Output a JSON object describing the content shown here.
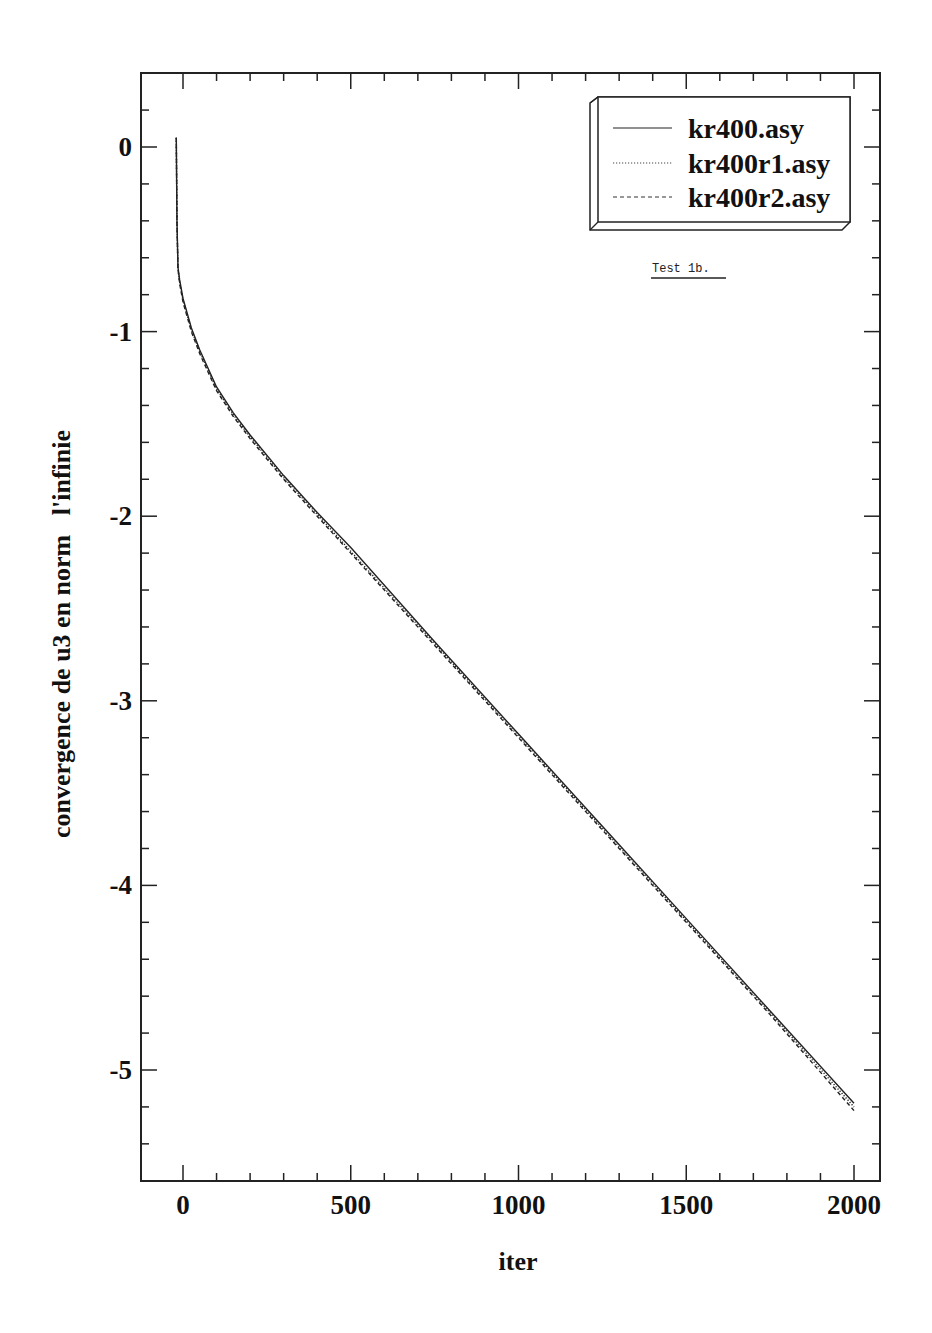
{
  "chart_data": {
    "type": "line",
    "title": "",
    "annotation": "Test 1b.",
    "xlabel": "iter",
    "ylabel": "convergence de u3 en norm   l'infinie",
    "xlim": [
      -100,
      2050
    ],
    "ylim": [
      -5.6,
      0.4
    ],
    "xticks": [
      0,
      500,
      1000,
      1500,
      2000
    ],
    "xtick_labels": [
      "0",
      "500",
      "1000",
      "1500",
      "2000"
    ],
    "yticks": [
      0,
      -1,
      -2,
      -3,
      -4,
      -5
    ],
    "ytick_labels": [
      "0",
      "-1",
      "-2",
      "-3",
      "-4",
      "-5"
    ],
    "grid": false,
    "legend_position": "upper right",
    "series": [
      {
        "name": "kr400.asy",
        "style": "solid",
        "x": [
          -20,
          -18,
          -15,
          -10,
          0,
          25,
          50,
          100,
          150,
          200,
          300,
          400,
          500,
          750,
          1000,
          1250,
          1500,
          1750,
          2000
        ],
        "y": [
          0.05,
          -0.4,
          -0.65,
          -0.72,
          -0.82,
          -0.98,
          -1.1,
          -1.3,
          -1.44,
          -1.56,
          -1.78,
          -1.98,
          -2.17,
          -2.68,
          -3.18,
          -3.68,
          -4.18,
          -4.68,
          -5.18
        ]
      },
      {
        "name": "kr400r1.asy",
        "style": "dotted",
        "x": [
          -20,
          -18,
          -15,
          -10,
          0,
          25,
          50,
          100,
          150,
          200,
          300,
          400,
          500,
          750,
          1000,
          1250,
          1500,
          1750,
          2000
        ],
        "y": [
          0.05,
          -0.4,
          -0.66,
          -0.73,
          -0.83,
          -0.99,
          -1.11,
          -1.31,
          -1.45,
          -1.57,
          -1.79,
          -1.99,
          -2.19,
          -2.69,
          -3.19,
          -3.69,
          -4.19,
          -4.69,
          -5.2
        ]
      },
      {
        "name": "kr400r2.asy",
        "style": "dashed",
        "x": [
          -20,
          -18,
          -15,
          -10,
          0,
          25,
          50,
          100,
          150,
          200,
          300,
          400,
          500,
          750,
          1000,
          1250,
          1500,
          1750,
          2000
        ],
        "y": [
          0.05,
          -0.4,
          -0.66,
          -0.74,
          -0.84,
          -1.0,
          -1.12,
          -1.32,
          -1.46,
          -1.58,
          -1.8,
          -2.0,
          -2.2,
          -2.7,
          -3.2,
          -3.7,
          -4.2,
          -4.7,
          -5.22
        ]
      }
    ]
  },
  "legend": {
    "items": [
      {
        "label": "kr400.asy"
      },
      {
        "label": "kr400r1.asy"
      },
      {
        "label": "kr400r2.asy"
      }
    ]
  },
  "axes": {
    "xlabel": "iter",
    "ylabel": "convergence de u3 en norm   l'infinie"
  },
  "annotation": "Test 1b."
}
